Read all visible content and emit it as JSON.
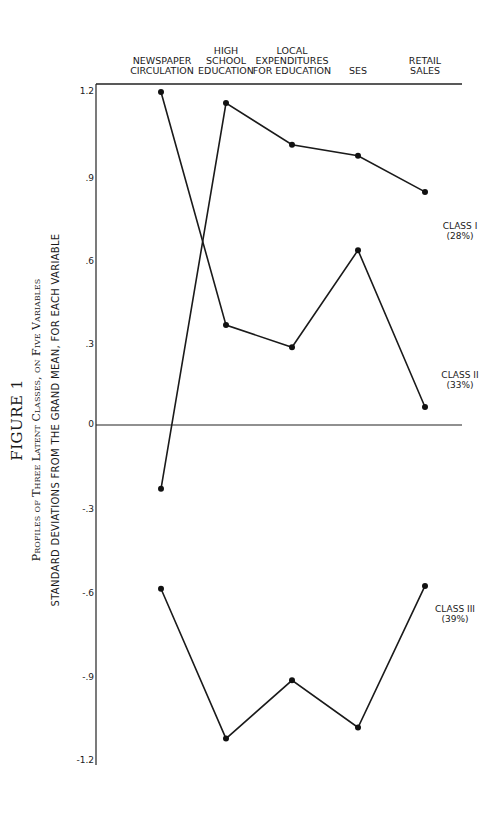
{
  "figure": {
    "label": "FIGURE 1",
    "subtitle": "Profiles of Three Latent Classes, on Five Variables",
    "ylabel": "STANDARD DEVIATIONS FROM THE GRAND MEAN, FOR EACH VARIABLE"
  },
  "columns": [
    {
      "label": "NEWSPAPER\nCIRCULATION"
    },
    {
      "label": "HIGH\nSCHOOL\nEDUCATION"
    },
    {
      "label": "LOCAL\nEXPENDITURES\nFOR EDUCATION"
    },
    {
      "label": "SES"
    },
    {
      "label": "RETAIL\nSALES"
    }
  ],
  "yticks": [
    "1.2",
    ".9",
    ".6",
    ".3",
    "0",
    "-.3",
    "-.6",
    "-.9",
    "-1.2"
  ],
  "classes": [
    {
      "name": "CLASS I",
      "pct": "(28%)"
    },
    {
      "name": "CLASS II",
      "pct": "(33%)"
    },
    {
      "name": "CLASS III",
      "pct": "(39%)"
    }
  ],
  "chart_data": {
    "type": "line",
    "xlabel": "",
    "ylabel": "Standard deviations from the grand mean, for each variable",
    "categories": [
      "Newspaper Circulation",
      "High School Education",
      "Local Expenditures for Education",
      "SES",
      "Retail Sales"
    ],
    "ylim": [
      -1.2,
      1.2
    ],
    "yticks": [
      1.2,
      0.9,
      0.6,
      0.3,
      0,
      -0.3,
      -0.6,
      -0.9,
      -1.2
    ],
    "grid": false,
    "legend_position": "right (inline labels)",
    "series": [
      {
        "name": "Class I (28%)",
        "values": [
          -0.23,
          1.16,
          1.01,
          0.97,
          0.84
        ]
      },
      {
        "name": "Class II (33%)",
        "values": [
          1.2,
          0.36,
          0.28,
          0.63,
          0.065
        ]
      },
      {
        "name": "Class III (39%)",
        "values": [
          -0.59,
          -1.13,
          -0.92,
          -1.09,
          -0.58
        ]
      }
    ]
  }
}
